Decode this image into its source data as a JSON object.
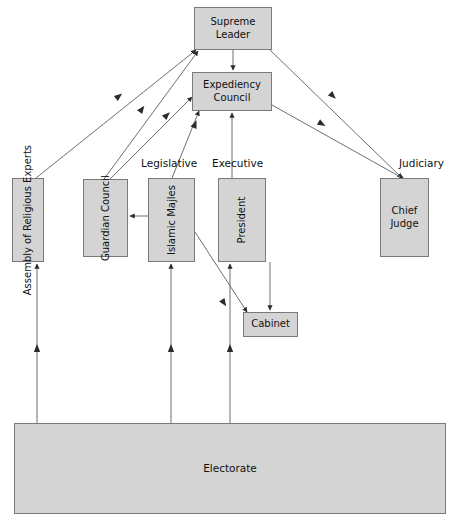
{
  "diagram": {
    "palette": {
      "node_fill": "#d4d4d4",
      "node_border": "#7a7a7a",
      "edge_color": "#6f6f6f",
      "text_color": "#111111",
      "background": "#ffffff"
    },
    "nodes": [
      {
        "id": "supreme-leader",
        "label": "Supreme\nLeader",
        "orientation": "horizontal",
        "x": 194,
        "y": 7,
        "w": 78,
        "h": 43
      },
      {
        "id": "expediency",
        "label": "Expediency\nCouncil",
        "orientation": "horizontal",
        "x": 192,
        "y": 72,
        "w": 80,
        "h": 39
      },
      {
        "id": "assembly",
        "label": "Assembly of\nReligious\nExperts",
        "orientation": "vertical",
        "x": 12,
        "y": 178,
        "w": 32,
        "h": 84
      },
      {
        "id": "guardian",
        "label": "Guardian\nCouncil",
        "orientation": "vertical",
        "x": 83,
        "y": 179,
        "w": 45,
        "h": 78
      },
      {
        "id": "majles",
        "label": "Islamic\nMajles",
        "orientation": "vertical",
        "x": 148,
        "y": 178,
        "w": 47,
        "h": 84
      },
      {
        "id": "president",
        "label": "President",
        "orientation": "vertical",
        "x": 218,
        "y": 178,
        "w": 48,
        "h": 84
      },
      {
        "id": "chief-judge",
        "label": "Chief\nJudge",
        "orientation": "horizontal",
        "x": 380,
        "y": 178,
        "w": 49,
        "h": 79
      },
      {
        "id": "cabinet",
        "label": "Cabinet",
        "orientation": "horizontal",
        "x": 243,
        "y": 312,
        "w": 55,
        "h": 25
      },
      {
        "id": "electorate",
        "label": "Electorate",
        "orientation": "horizontal",
        "x": 14,
        "y": 423,
        "w": 432,
        "h": 91
      }
    ],
    "branch_labels": [
      {
        "id": "legislative",
        "text": "Legislative",
        "x": 141,
        "y": 157
      },
      {
        "id": "executive",
        "text": "Executive",
        "x": 212,
        "y": 157
      },
      {
        "id": "judiciary",
        "text": "Judiciary",
        "x": 399,
        "y": 157
      }
    ],
    "edges": [
      {
        "id": "supreme-to-expediency",
        "from": "supreme-leader",
        "to": "expediency",
        "points": "233,50 233,70",
        "arrow": "end"
      },
      {
        "id": "supreme-to-assembly",
        "from": "assembly",
        "to": "supreme-leader",
        "points": "36,178 196,50",
        "arrow": "end"
      },
      {
        "id": "supreme-to-guardian",
        "from": "guardian",
        "to": "supreme-leader",
        "points": "104,179 198,51",
        "arrow": "end"
      },
      {
        "id": "supreme-to-chief-judge",
        "from": "supreme-leader",
        "to": "chief-judge",
        "points": "270,50 402,178",
        "arrow": "end"
      },
      {
        "id": "expediency-to-guardian",
        "from": "guardian",
        "to": "expediency",
        "points": "110,179 192,97",
        "arrow": "end"
      },
      {
        "id": "expediency-to-majles",
        "from": "majles",
        "to": "expediency",
        "points": "172,178 199,111",
        "arrow": "end"
      },
      {
        "id": "expediency-to-president",
        "from": "president",
        "to": "expediency",
        "points": "232,178 232,113",
        "arrow": "end"
      },
      {
        "id": "expediency-to-chief",
        "from": "expediency",
        "to": "chief-judge",
        "points": "272,105 404,179",
        "arrow": "end"
      },
      {
        "id": "majles-to-guardian",
        "from": "majles",
        "to": "guardian",
        "points": "148,216 130,216",
        "arrow": "end"
      },
      {
        "id": "majles-to-cabinet",
        "from": "majles",
        "to": "cabinet",
        "points": "195,232 247,312",
        "arrow": "end"
      },
      {
        "id": "president-to-cabinet",
        "from": "president",
        "to": "cabinet",
        "points": "270,262 270,310",
        "arrow": "end"
      },
      {
        "id": "electorate-to-assembly",
        "from": "electorate",
        "to": "assembly",
        "points": "37,423 37,264",
        "arrow": "end"
      },
      {
        "id": "electorate-to-majles",
        "from": "electorate",
        "to": "majles",
        "points": "171,423 171,264",
        "arrow": "end"
      },
      {
        "id": "electorate-to-president",
        "from": "electorate",
        "to": "president",
        "points": "230,423 230,264",
        "arrow": "end"
      }
    ]
  }
}
